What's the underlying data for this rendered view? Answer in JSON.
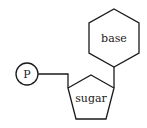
{
  "diagram": {
    "nodes": [
      {
        "id": "phosphate",
        "shape": "circle",
        "label": "P"
      },
      {
        "id": "sugar",
        "shape": "pentagon",
        "label": "sugar"
      },
      {
        "id": "base",
        "shape": "hexagon",
        "label": "base"
      }
    ],
    "edges": [
      {
        "from": "phosphate",
        "to": "sugar"
      },
      {
        "from": "sugar",
        "to": "base"
      }
    ],
    "colors": {
      "stroke": "#1a1a1a",
      "background": "#ffffff"
    }
  }
}
